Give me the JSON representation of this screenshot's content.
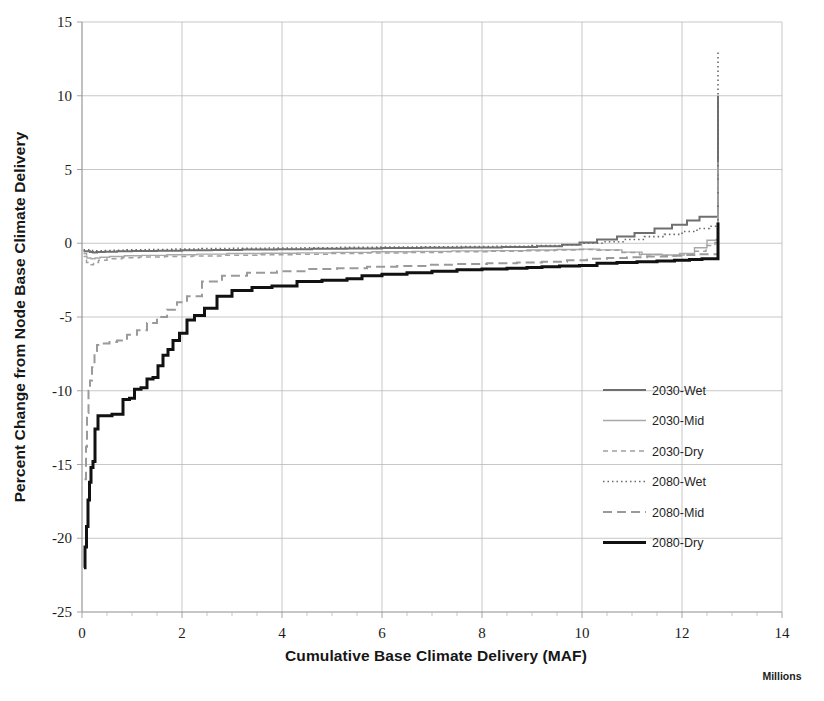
{
  "chart_data": {
    "type": "line",
    "title": "",
    "subtitle": "",
    "xlabel": "Cumulative Base Climate Delivery (MAF)",
    "ylabel": "Percent Change from Node Base Climate Delivery",
    "x_axis_multiplier_label": "Millions",
    "xlim": [
      0,
      14
    ],
    "ylim": [
      -25,
      15
    ],
    "xticks": [
      0,
      2,
      4,
      6,
      8,
      10,
      12,
      14
    ],
    "xtick_labels": [
      "0",
      "2",
      "4",
      "6",
      "8",
      "10",
      "12",
      "14"
    ],
    "x_minor_tick_step": 0.5,
    "yticks": [
      -25,
      -20,
      -15,
      -10,
      -5,
      0,
      5,
      10,
      15
    ],
    "ytick_labels": [
      "-25",
      "-20",
      "-15",
      "-10",
      "-5",
      "0",
      "5",
      "10",
      "15"
    ],
    "grid": {
      "x": true,
      "y": true,
      "major_x_step": 2,
      "major_y_step": 5
    },
    "legend": {
      "position": "right-middle",
      "frame": false
    },
    "series": [
      {
        "name": "2030-Wet",
        "color": "#6f6f6f",
        "width": 2.0,
        "dash": "none",
        "x": [
          0.03,
          0.1,
          0.16,
          0.22,
          0.3,
          0.45,
          0.7,
          1.0,
          1.5,
          2.0,
          2.6,
          3.2,
          3.9,
          4.6,
          5.3,
          6.0,
          6.8,
          7.6,
          8.4,
          9.1,
          9.6,
          9.95,
          10.3,
          10.7,
          11.05,
          11.45,
          11.8,
          12.1,
          12.35,
          12.6,
          12.7,
          12.72,
          12.72
        ],
        "y": [
          -0.55,
          -0.55,
          -0.6,
          -0.62,
          -0.6,
          -0.58,
          -0.55,
          -0.52,
          -0.5,
          -0.48,
          -0.45,
          -0.42,
          -0.4,
          -0.38,
          -0.35,
          -0.32,
          -0.3,
          -0.28,
          -0.25,
          -0.2,
          -0.1,
          0.05,
          0.25,
          0.45,
          0.7,
          1.0,
          1.25,
          1.55,
          1.8,
          1.8,
          1.8,
          10.0,
          10.0
        ]
      },
      {
        "name": "2030-Mid",
        "color": "#a8a8a8",
        "width": 1.4,
        "dash": "none",
        "x": [
          0.03,
          0.1,
          0.18,
          0.26,
          0.36,
          0.55,
          0.85,
          1.2,
          1.7,
          2.3,
          2.9,
          3.6,
          4.3,
          5.0,
          5.8,
          6.6,
          7.4,
          8.2,
          8.9,
          9.5,
          9.95,
          10.35,
          10.8,
          11.2,
          11.6,
          11.95,
          12.25,
          12.5,
          12.68,
          12.7,
          12.72
        ],
        "y": [
          -0.9,
          -1.0,
          -1.05,
          -1.0,
          -0.95,
          -0.9,
          -0.85,
          -0.82,
          -0.78,
          -0.74,
          -0.7,
          -0.68,
          -0.65,
          -0.62,
          -0.58,
          -0.55,
          -0.52,
          -0.5,
          -0.46,
          -0.42,
          -0.4,
          -0.45,
          -0.6,
          -0.75,
          -0.8,
          -0.7,
          -0.3,
          0.2,
          0.25,
          0.25,
          5.6
        ]
      },
      {
        "name": "2030-Dry",
        "color": "#a0a0a0",
        "width": 1.5,
        "dash": "5,4",
        "x": [
          0.03,
          0.09,
          0.15,
          0.23,
          0.33,
          0.5,
          0.8,
          1.15,
          1.65,
          2.2,
          2.85,
          3.5,
          4.2,
          4.95,
          5.7,
          6.5,
          7.3,
          8.1,
          8.85,
          9.45,
          9.9,
          10.3,
          10.75,
          11.15,
          11.55,
          11.9,
          12.2,
          12.48,
          12.66,
          12.7,
          12.72
        ],
        "y": [
          -0.7,
          -1.3,
          -1.45,
          -1.3,
          -1.15,
          -1.05,
          -0.98,
          -0.94,
          -0.9,
          -0.86,
          -0.82,
          -0.78,
          -0.74,
          -0.7,
          -0.66,
          -0.62,
          -0.58,
          -0.55,
          -0.5,
          -0.45,
          -0.42,
          -0.48,
          -0.62,
          -0.78,
          -0.86,
          -0.8,
          -0.55,
          -0.15,
          0.05,
          0.05,
          4.1
        ]
      },
      {
        "name": "2080-Wet",
        "color": "#6a6a6a",
        "width": 1.6,
        "dash": "1.5,3",
        "x": [
          0.03,
          0.1,
          0.18,
          0.28,
          0.4,
          0.6,
          0.9,
          1.3,
          1.8,
          2.4,
          3.0,
          3.7,
          4.4,
          5.1,
          5.9,
          6.7,
          7.5,
          8.3,
          9.0,
          9.55,
          10.0,
          10.4,
          10.85,
          11.25,
          11.65,
          12.0,
          12.3,
          12.55,
          12.7,
          12.72,
          12.72
        ],
        "y": [
          -0.45,
          -0.45,
          -0.5,
          -0.52,
          -0.5,
          -0.48,
          -0.45,
          -0.42,
          -0.4,
          -0.36,
          -0.34,
          -0.32,
          -0.3,
          -0.28,
          -0.26,
          -0.24,
          -0.22,
          -0.2,
          -0.16,
          -0.1,
          0.0,
          0.1,
          0.25,
          0.45,
          0.6,
          0.8,
          1.0,
          1.15,
          1.15,
          13.0,
          13.0
        ]
      },
      {
        "name": "2080-Mid",
        "color": "#9a9a9a",
        "width": 2.0,
        "dash": "9,5",
        "x": [
          0.05,
          0.08,
          0.1,
          0.13,
          0.16,
          0.2,
          0.25,
          0.3,
          0.4,
          0.55,
          0.7,
          0.9,
          1.1,
          1.3,
          1.5,
          1.7,
          1.9,
          2.1,
          2.4,
          2.8,
          3.3,
          3.9,
          4.5,
          5.1,
          5.7,
          6.3,
          6.9,
          7.5,
          8.1,
          8.7,
          9.2,
          9.7,
          10.1,
          10.5,
          10.9,
          11.3,
          11.7,
          12.05,
          12.35,
          12.6,
          12.7,
          12.72,
          12.72
        ],
        "y": [
          -16.0,
          -13.8,
          -11.5,
          -10.0,
          -9.3,
          -8.4,
          -7.3,
          -6.9,
          -6.8,
          -6.7,
          -6.6,
          -6.2,
          -5.9,
          -5.4,
          -5.0,
          -4.5,
          -4.0,
          -3.6,
          -2.6,
          -2.2,
          -2.0,
          -1.9,
          -1.75,
          -1.7,
          -1.6,
          -1.55,
          -1.45,
          -1.4,
          -1.35,
          -1.3,
          -1.25,
          -1.15,
          -1.05,
          -1.0,
          -0.95,
          -0.9,
          -0.85,
          -0.8,
          -0.75,
          -0.75,
          -0.75,
          5.2,
          5.2
        ]
      },
      {
        "name": "2080-Dry",
        "color": "#111111",
        "width": 3.0,
        "dash": "none",
        "x": [
          0.04,
          0.06,
          0.09,
          0.12,
          0.15,
          0.18,
          0.22,
          0.26,
          0.32,
          0.45,
          0.6,
          0.75,
          0.82,
          0.95,
          1.05,
          1.18,
          1.3,
          1.42,
          1.52,
          1.62,
          1.72,
          1.82,
          1.95,
          2.1,
          2.25,
          2.45,
          2.7,
          3.0,
          3.4,
          3.8,
          4.3,
          4.8,
          5.3,
          5.6,
          6.0,
          6.5,
          7.0,
          7.5,
          8.0,
          8.5,
          8.9,
          9.2,
          9.55,
          9.95,
          10.3,
          10.7,
          11.1,
          11.5,
          11.85,
          12.15,
          12.4,
          12.6,
          12.72,
          12.72,
          12.72
        ],
        "y": [
          -22.0,
          -20.6,
          -19.2,
          -17.4,
          -16.2,
          -15.2,
          -14.8,
          -12.6,
          -11.7,
          -11.7,
          -11.6,
          -11.6,
          -10.6,
          -10.5,
          -9.9,
          -9.8,
          -9.2,
          -9.1,
          -8.3,
          -7.6,
          -7.2,
          -6.6,
          -6.1,
          -5.2,
          -4.9,
          -4.4,
          -3.6,
          -3.2,
          -3.0,
          -2.9,
          -2.6,
          -2.5,
          -2.4,
          -2.2,
          -2.1,
          -2.0,
          -1.9,
          -1.8,
          -1.75,
          -1.7,
          -1.65,
          -1.6,
          -1.55,
          -1.5,
          -1.35,
          -1.3,
          -1.25,
          -1.2,
          -1.15,
          -1.1,
          -1.05,
          -1.05,
          -1.05,
          1.4,
          1.4
        ]
      }
    ]
  },
  "legend_items": [
    {
      "label": "2030-Wet"
    },
    {
      "label": "2030-Mid"
    },
    {
      "label": "2030-Dry"
    },
    {
      "label": "2080-Wet"
    },
    {
      "label": "2080-Mid"
    },
    {
      "label": "2080-Dry"
    }
  ]
}
